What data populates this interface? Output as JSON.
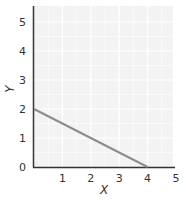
{
  "chart_data": {
    "type": "line",
    "title": "",
    "xlabel": "X",
    "ylabel": "Y",
    "xlim": [
      0,
      5
    ],
    "ylim": [
      0,
      5
    ],
    "x_ticks": [
      "1",
      "2",
      "3",
      "4",
      "5"
    ],
    "y_ticks": [
      "0",
      "1",
      "2",
      "3",
      "4",
      "5"
    ],
    "grid": true,
    "legend": null,
    "series": [
      {
        "name": "line",
        "x": [
          0,
          4
        ],
        "y": [
          2,
          0
        ],
        "color": "#8c8c8c"
      }
    ]
  },
  "style": {
    "plot_background": "#f3f3f3",
    "grid_color": "#ffffff",
    "axis_color": "#333333",
    "line_color": "#8c8c8c"
  }
}
